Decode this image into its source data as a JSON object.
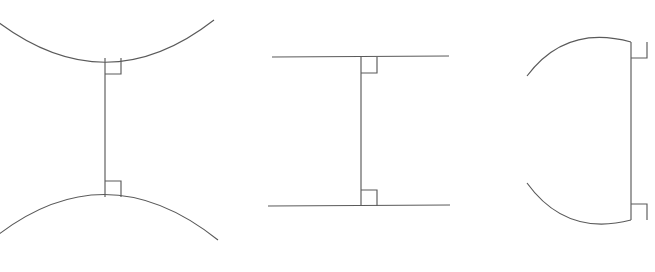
{
  "figure": {
    "background_color": "#ffffff",
    "stroke_color": "#5a5a5a",
    "stroke_width": 1.15,
    "width": 655,
    "height": 272,
    "panel_count": 3
  },
  "panels": [
    {
      "id": "panel-1",
      "name": "concave-curves-pair",
      "description": "Two opposing arcs, the upper concave upward and the lower concave downward, joined by a vertical common perpendicular segment with right-angle markers at both contact points.",
      "elements": {
        "upper_curve": {
          "type": "arc",
          "name": "upper-arc",
          "concavity": "up",
          "start": [
            -6,
            19
          ],
          "control": [
            105,
            105
          ],
          "end": [
            214,
            20
          ],
          "vertex": [
            105,
            58
          ]
        },
        "lower_curve": {
          "type": "arc",
          "name": "lower-arc",
          "concavity": "down",
          "start": [
            -6,
            238
          ],
          "control": [
            105,
            150
          ],
          "end": [
            218,
            240
          ],
          "vertex": [
            105,
            197
          ]
        },
        "segment": {
          "type": "line",
          "name": "common-perpendicular",
          "start": [
            105,
            58
          ],
          "end": [
            105,
            197
          ],
          "orientation": "vertical",
          "length": 139
        },
        "angle_markers": [
          {
            "name": "right-angle-marker-top",
            "corner": [
              105,
              58
            ],
            "size": 16,
            "dx": 1,
            "dy": 1
          },
          {
            "name": "right-angle-marker-bottom",
            "corner": [
              105,
              197
            ],
            "size": 16,
            "dx": 1,
            "dy": -1
          }
        ]
      }
    },
    {
      "id": "panel-2",
      "name": "parallel-lines-pair",
      "description": "Two horizontal parallel straight lines joined by a vertical common perpendicular segment with right-angle markers at both contact points.",
      "elements": {
        "upper_line": {
          "type": "line",
          "name": "upper-parallel-line",
          "start": [
            272,
            57
          ],
          "end": [
            449,
            56
          ],
          "orientation": "horizontal"
        },
        "lower_line": {
          "type": "line",
          "name": "lower-parallel-line",
          "start": [
            268,
            206
          ],
          "end": [
            450,
            205
          ],
          "orientation": "horizontal"
        },
        "segment": {
          "type": "line",
          "name": "common-perpendicular",
          "start": [
            361,
            57
          ],
          "end": [
            361,
            206
          ],
          "orientation": "vertical",
          "length": 149
        },
        "angle_markers": [
          {
            "name": "right-angle-marker-top",
            "corner": [
              361,
              57
            ],
            "size": 16,
            "dx": 1,
            "dy": 1
          },
          {
            "name": "right-angle-marker-bottom",
            "corner": [
              361,
              206
            ],
            "size": 16,
            "dx": 1,
            "dy": -1
          }
        ]
      }
    },
    {
      "id": "panel-3",
      "name": "curves-meeting-line-pair",
      "description": "Two arcs curving away to the left, each meeting a shared vertical line at a right angle, with right-angle markers at both contact points.",
      "elements": {
        "upper_curve": {
          "type": "arc",
          "name": "upper-arc",
          "concavity": "down",
          "start": [
            527,
            76
          ],
          "control": [
            566,
            24
          ],
          "end": [
            631,
            42
          ],
          "vertex": [
            631,
            42
          ]
        },
        "lower_curve": {
          "type": "arc",
          "name": "lower-arc",
          "concavity": "up",
          "start": [
            527,
            183
          ],
          "control": [
            566,
            237
          ],
          "end": [
            631,
            220
          ],
          "vertex": [
            631,
            220
          ]
        },
        "segment": {
          "type": "line",
          "name": "common-perpendicular",
          "start": [
            631,
            42
          ],
          "end": [
            631,
            220
          ],
          "orientation": "vertical",
          "length": 178
        },
        "angle_markers": [
          {
            "name": "right-angle-marker-top",
            "corner": [
              631,
              42
            ],
            "size": 16,
            "dx": 1,
            "dy": 1
          },
          {
            "name": "right-angle-marker-bottom",
            "corner": [
              631,
              220
            ],
            "size": 16,
            "dx": 1,
            "dy": -1
          }
        ]
      }
    }
  ]
}
